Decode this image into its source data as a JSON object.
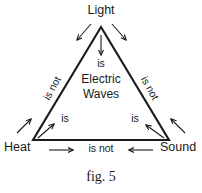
{
  "figure": {
    "caption": "fig. 5",
    "vertices": {
      "top": "Light",
      "bottom_left": "Heat",
      "bottom_right": "Sound"
    },
    "center": {
      "line1": "Electric",
      "line2": "Waves"
    },
    "relations": {
      "light_to_center": "is",
      "heat_to_center": "is",
      "sound_to_center": "is",
      "light_to_heat": "is not",
      "light_to_sound": "is not",
      "heat_to_sound": "is not"
    },
    "colors": {
      "stroke": "#1a1a1a",
      "background": "#ffffff"
    }
  }
}
